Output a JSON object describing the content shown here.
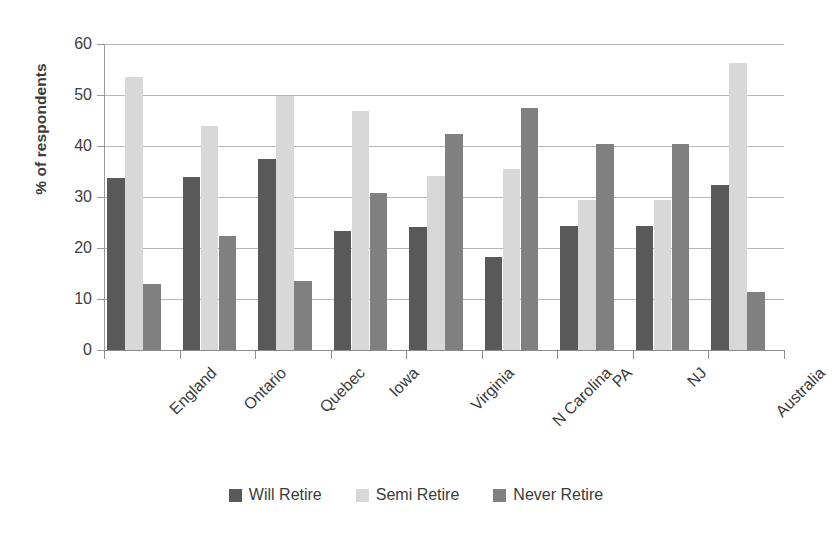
{
  "chart_data": {
    "type": "bar",
    "title": "",
    "subtitle": "",
    "xlabel": "",
    "ylabel": "% of respondents",
    "ylim": [
      0,
      60
    ],
    "yticks": [
      0,
      10,
      20,
      30,
      40,
      50,
      60
    ],
    "ytick_labels": [
      "0",
      "10",
      "20",
      "30",
      "40",
      "50",
      "60"
    ],
    "grid": true,
    "legend_position": "bottom",
    "categories": [
      "England",
      "Ontario",
      "Quebec",
      "Iowa",
      "Virginia",
      "N Carolina",
      "PA",
      "NJ",
      "Australia"
    ],
    "series": [
      {
        "name": "Will Retire",
        "color": "#595959",
        "values": [
          33.8,
          34.0,
          37.4,
          23.3,
          24.2,
          18.3,
          24.4,
          24.4,
          32.3
        ]
      },
      {
        "name": "Semi Retire",
        "color": "#d8d8d8",
        "values": [
          53.6,
          44.0,
          49.9,
          46.8,
          34.2,
          35.4,
          29.4,
          29.5,
          56.3
        ]
      },
      {
        "name": "Never Retire",
        "color": "#808080",
        "values": [
          13.0,
          22.3,
          13.6,
          30.8,
          42.4,
          47.4,
          40.4,
          40.4,
          11.3
        ]
      }
    ]
  }
}
